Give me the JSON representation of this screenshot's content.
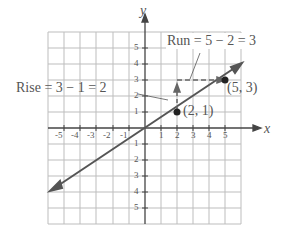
{
  "diagram": {
    "axis_labels": {
      "x": "x",
      "y": "y"
    },
    "x_ticks": [
      "-5",
      "-4",
      "-3",
      "-2",
      "-1",
      "1",
      "2",
      "3",
      "4",
      "5"
    ],
    "y_ticks": [
      "5",
      "4",
      "3",
      "2",
      "1",
      "1",
      "2",
      "3",
      "4",
      "5"
    ],
    "y_tick_neg_prefix": "-",
    "points": [
      {
        "label": "(2, 1)",
        "x": 2,
        "y": 1
      },
      {
        "label": "(5, 3)",
        "x": 5,
        "y": 3
      }
    ],
    "rise_label": "Rise = 3 − 1 = 2",
    "run_label": "Run = 5 − 2 = 3",
    "colors": {
      "grid": "#b0b0b0",
      "line": "#555555",
      "text": "#555555",
      "arrow": "#666666"
    }
  }
}
